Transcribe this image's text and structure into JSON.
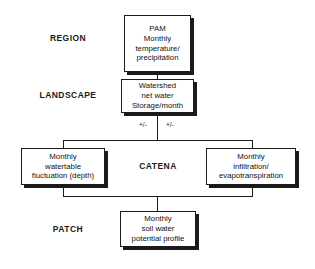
{
  "diagram": {
    "levels": [
      {
        "id": "region",
        "label": "REGION"
      },
      {
        "id": "landscape",
        "label": "LANDSCAPE"
      },
      {
        "id": "catena",
        "label": "CATENA"
      },
      {
        "id": "patch",
        "label": "PATCH"
      }
    ],
    "nodes": [
      {
        "id": "pam",
        "text": "PAM\nMonthly\ntemperature/\nprecipitation"
      },
      {
        "id": "watershed",
        "text": "Watershed\nnet water\nStorage/month"
      },
      {
        "id": "watertable",
        "text": "Monthly\nwatertable\nfluctuation (depth)"
      },
      {
        "id": "infiltration",
        "text": "Monthly\ninfiltration/\nevapotranspiration"
      },
      {
        "id": "soilwater",
        "text": "Monthly\nsoil water\npotential profile"
      }
    ],
    "flux_labels": [
      {
        "id": "flux-left",
        "text": "+/-"
      },
      {
        "id": "flux-right",
        "text": "+/-"
      }
    ],
    "colors": {
      "stroke": "#1a1a1a",
      "fill": "#ffffff",
      "shadow": "#1a1a1a"
    }
  }
}
